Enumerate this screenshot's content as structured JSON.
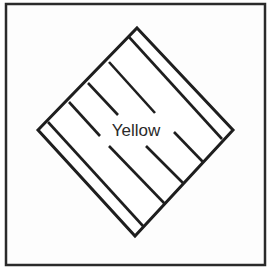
{
  "figure": {
    "label": "Yellow",
    "frame": {
      "x": 6,
      "y": 4,
      "width": 259,
      "height": 261
    },
    "diamond": {
      "top": [
        137,
        28
      ],
      "right": [
        233,
        130
      ],
      "bottom": [
        135,
        236
      ],
      "left": [
        38,
        130
      ]
    },
    "stripes": [
      {
        "x1": 129,
        "y1": 37,
        "x2": 222,
        "y2": 139
      },
      {
        "x1": 109,
        "y1": 62,
        "x2": 155,
        "y2": 113
      },
      {
        "x1": 88,
        "y1": 83,
        "x2": 118,
        "y2": 115
      },
      {
        "x1": 69,
        "y1": 102,
        "x2": 100,
        "y2": 136
      },
      {
        "x1": 48,
        "y1": 122,
        "x2": 143,
        "y2": 226
      },
      {
        "x1": 174,
        "y1": 132,
        "x2": 203,
        "y2": 162
      },
      {
        "x1": 146,
        "y1": 146,
        "x2": 183,
        "y2": 183
      },
      {
        "x1": 109,
        "y1": 146,
        "x2": 165,
        "y2": 204
      }
    ],
    "colors": {
      "stroke": "#1e1e1e",
      "background": "#ffffff"
    }
  }
}
